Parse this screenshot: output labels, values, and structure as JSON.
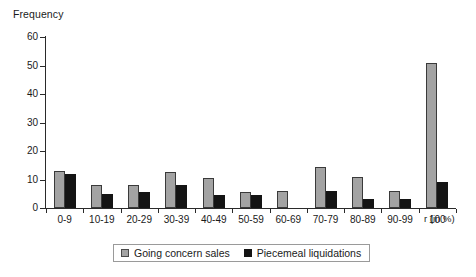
{
  "chart_data": {
    "type": "bar",
    "title": "",
    "subtitle": "",
    "ylabel": "Frequency",
    "xlabel": "r (in %)",
    "ylim": [
      0,
      60
    ],
    "ytick_step": 10,
    "yticks": [
      "0",
      "10",
      "20",
      "30",
      "40",
      "50",
      "60"
    ],
    "grid": false,
    "legend_position": "bottom",
    "categories": [
      "0-9",
      "10-19",
      "20-29",
      "30-39",
      "40-49",
      "50-59",
      "60-69",
      "70-79",
      "80-89",
      "90-99",
      "100"
    ],
    "series": [
      {
        "name": "Going concern sales",
        "color": "#a3a3a3",
        "values": [
          13,
          8,
          8,
          12.5,
          10.5,
          5.5,
          6,
          14.5,
          11,
          6,
          51
        ]
      },
      {
        "name": "Piecemeal liquidations",
        "color": "#141414",
        "values": [
          12,
          5,
          5.5,
          8,
          4.5,
          4.5,
          0,
          6,
          3,
          3,
          9
        ]
      }
    ],
    "annotations": []
  }
}
